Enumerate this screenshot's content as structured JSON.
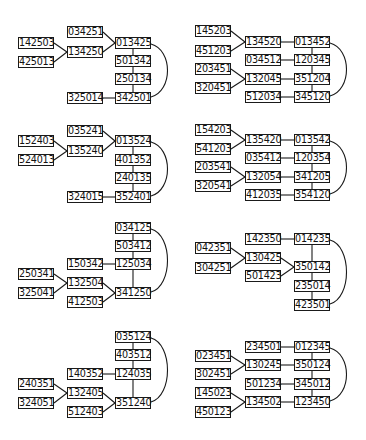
{
  "panels": [
    {
      "id": "p1",
      "nodes": [
        {
          "label": "034251",
          "x": 67,
          "y": 26
        },
        {
          "label": "142503",
          "x": 18,
          "y": 37
        },
        {
          "label": "013425",
          "x": 115,
          "y": 37
        },
        {
          "label": "134250",
          "x": 67,
          "y": 46
        },
        {
          "label": "425013",
          "x": 18,
          "y": 56
        },
        {
          "label": "501342",
          "x": 115,
          "y": 55
        },
        {
          "label": "250134",
          "x": 115,
          "y": 73
        },
        {
          "label": "325014",
          "x": 67,
          "y": 92
        },
        {
          "label": "342501",
          "x": 115,
          "y": 92
        }
      ],
      "edges": [
        [
          0,
          2
        ],
        [
          1,
          3
        ],
        [
          4,
          3
        ],
        [
          3,
          2
        ],
        [
          2,
          5
        ],
        [
          5,
          6
        ],
        [
          6,
          8
        ],
        [
          7,
          8
        ]
      ],
      "arcs": [
        [
          2,
          8
        ]
      ]
    },
    {
      "id": "p2",
      "nodes": [
        {
          "label": "145203",
          "x": 195,
          "y": 25
        },
        {
          "label": "134520",
          "x": 245,
          "y": 36
        },
        {
          "label": "013452",
          "x": 294,
          "y": 36
        },
        {
          "label": "451203",
          "x": 195,
          "y": 45
        },
        {
          "label": "034512",
          "x": 245,
          "y": 54
        },
        {
          "label": "120345",
          "x": 294,
          "y": 54
        },
        {
          "label": "203451",
          "x": 195,
          "y": 63
        },
        {
          "label": "132045",
          "x": 245,
          "y": 73
        },
        {
          "label": "351204",
          "x": 294,
          "y": 73
        },
        {
          "label": "320451",
          "x": 195,
          "y": 82
        },
        {
          "label": "512034",
          "x": 245,
          "y": 91
        },
        {
          "label": "345120",
          "x": 294,
          "y": 91
        }
      ],
      "edges": [
        [
          0,
          1
        ],
        [
          3,
          1
        ],
        [
          1,
          2
        ],
        [
          4,
          5
        ],
        [
          6,
          7
        ],
        [
          9,
          7
        ],
        [
          7,
          8
        ],
        [
          10,
          11
        ],
        [
          2,
          5
        ],
        [
          5,
          8
        ],
        [
          8,
          11
        ]
      ],
      "arcs": [
        [
          2,
          11
        ]
      ]
    },
    {
      "id": "p3",
      "nodes": [
        {
          "label": "035241",
          "x": 67,
          "y": 125
        },
        {
          "label": "152403",
          "x": 18,
          "y": 135
        },
        {
          "label": "013524",
          "x": 115,
          "y": 135
        },
        {
          "label": "135240",
          "x": 67,
          "y": 145
        },
        {
          "label": "524013",
          "x": 18,
          "y": 154
        },
        {
          "label": "401352",
          "x": 115,
          "y": 154
        },
        {
          "label": "240135",
          "x": 115,
          "y": 172
        },
        {
          "label": "324015",
          "x": 67,
          "y": 191
        },
        {
          "label": "352401",
          "x": 115,
          "y": 191
        }
      ],
      "edges": [
        [
          0,
          2
        ],
        [
          1,
          3
        ],
        [
          4,
          3
        ],
        [
          3,
          2
        ],
        [
          2,
          5
        ],
        [
          5,
          6
        ],
        [
          6,
          8
        ],
        [
          7,
          8
        ]
      ],
      "arcs": [
        [
          2,
          8
        ]
      ]
    },
    {
      "id": "p4",
      "nodes": [
        {
          "label": "154203",
          "x": 195,
          "y": 124
        },
        {
          "label": "135420",
          "x": 245,
          "y": 134
        },
        {
          "label": "013542",
          "x": 294,
          "y": 134
        },
        {
          "label": "541203",
          "x": 195,
          "y": 143
        },
        {
          "label": "035412",
          "x": 245,
          "y": 152
        },
        {
          "label": "120354",
          "x": 294,
          "y": 152
        },
        {
          "label": "203541",
          "x": 195,
          "y": 161
        },
        {
          "label": "132054",
          "x": 245,
          "y": 171
        },
        {
          "label": "341205",
          "x": 294,
          "y": 171
        },
        {
          "label": "320541",
          "x": 195,
          "y": 180
        },
        {
          "label": "412035",
          "x": 245,
          "y": 189
        },
        {
          "label": "354120",
          "x": 294,
          "y": 189
        }
      ],
      "edges": [
        [
          0,
          1
        ],
        [
          3,
          1
        ],
        [
          1,
          2
        ],
        [
          4,
          5
        ],
        [
          6,
          7
        ],
        [
          9,
          7
        ],
        [
          7,
          8
        ],
        [
          10,
          11
        ],
        [
          2,
          5
        ],
        [
          5,
          8
        ],
        [
          8,
          11
        ]
      ],
      "arcs": [
        [
          2,
          11
        ]
      ]
    },
    {
      "id": "p5",
      "nodes": [
        {
          "label": "034125",
          "x": 115,
          "y": 222
        },
        {
          "label": "503412",
          "x": 115,
          "y": 240
        },
        {
          "label": "150342",
          "x": 67,
          "y": 258
        },
        {
          "label": "125034",
          "x": 115,
          "y": 258
        },
        {
          "label": "250341",
          "x": 18,
          "y": 268
        },
        {
          "label": "132504",
          "x": 67,
          "y": 277
        },
        {
          "label": "325041",
          "x": 18,
          "y": 287
        },
        {
          "label": "341250",
          "x": 115,
          "y": 287
        },
        {
          "label": "412503",
          "x": 67,
          "y": 296
        }
      ],
      "edges": [
        [
          0,
          1
        ],
        [
          1,
          3
        ],
        [
          2,
          3
        ],
        [
          3,
          7
        ],
        [
          4,
          5
        ],
        [
          6,
          5
        ],
        [
          5,
          7
        ],
        [
          8,
          7
        ]
      ],
      "arcs": [
        [
          0,
          7
        ]
      ]
    },
    {
      "id": "p6",
      "nodes": [
        {
          "label": "142350",
          "x": 245,
          "y": 233
        },
        {
          "label": "014235",
          "x": 294,
          "y": 233
        },
        {
          "label": "042351",
          "x": 195,
          "y": 242
        },
        {
          "label": "130425",
          "x": 245,
          "y": 252
        },
        {
          "label": "304251",
          "x": 195,
          "y": 262
        },
        {
          "label": "350142",
          "x": 294,
          "y": 261
        },
        {
          "label": "501423",
          "x": 245,
          "y": 270
        },
        {
          "label": "235014",
          "x": 294,
          "y": 280
        },
        {
          "label": "423501",
          "x": 294,
          "y": 299
        }
      ],
      "edges": [
        [
          0,
          1
        ],
        [
          2,
          3
        ],
        [
          4,
          3
        ],
        [
          3,
          5
        ],
        [
          6,
          5
        ],
        [
          1,
          5
        ],
        [
          5,
          7
        ],
        [
          7,
          8
        ]
      ],
      "arcs": [
        [
          1,
          8
        ]
      ]
    },
    {
      "id": "p7",
      "nodes": [
        {
          "label": "035124",
          "x": 115,
          "y": 331
        },
        {
          "label": "403512",
          "x": 115,
          "y": 349
        },
        {
          "label": "140352",
          "x": 67,
          "y": 368
        },
        {
          "label": "124035",
          "x": 115,
          "y": 368
        },
        {
          "label": "240351",
          "x": 18,
          "y": 378
        },
        {
          "label": "132405",
          "x": 67,
          "y": 387
        },
        {
          "label": "324051",
          "x": 18,
          "y": 397
        },
        {
          "label": "351240",
          "x": 115,
          "y": 397
        },
        {
          "label": "512403",
          "x": 67,
          "y": 406
        }
      ],
      "edges": [
        [
          0,
          1
        ],
        [
          1,
          3
        ],
        [
          2,
          3
        ],
        [
          3,
          7
        ],
        [
          4,
          5
        ],
        [
          6,
          5
        ],
        [
          5,
          7
        ],
        [
          8,
          7
        ]
      ],
      "arcs": [
        [
          0,
          7
        ]
      ]
    },
    {
      "id": "p8",
      "nodes": [
        {
          "label": "234501",
          "x": 245,
          "y": 341
        },
        {
          "label": "012345",
          "x": 294,
          "y": 341
        },
        {
          "label": "023451",
          "x": 195,
          "y": 350
        },
        {
          "label": "130245",
          "x": 245,
          "y": 359
        },
        {
          "label": "350124",
          "x": 294,
          "y": 359
        },
        {
          "label": "302451",
          "x": 195,
          "y": 368
        },
        {
          "label": "501234",
          "x": 245,
          "y": 378
        },
        {
          "label": "345012",
          "x": 294,
          "y": 378
        },
        {
          "label": "145023",
          "x": 195,
          "y": 387
        },
        {
          "label": "134502",
          "x": 245,
          "y": 396
        },
        {
          "label": "123450",
          "x": 294,
          "y": 396
        },
        {
          "label": "450123",
          "x": 195,
          "y": 406
        }
      ],
      "edges": [
        [
          0,
          1
        ],
        [
          2,
          3
        ],
        [
          5,
          3
        ],
        [
          3,
          4
        ],
        [
          6,
          7
        ],
        [
          8,
          9
        ],
        [
          11,
          9
        ],
        [
          9,
          10
        ],
        [
          1,
          4
        ],
        [
          4,
          7
        ],
        [
          7,
          10
        ]
      ],
      "arcs": [
        [
          1,
          10
        ]
      ]
    }
  ],
  "style": {
    "line_color": "#1a1a1a",
    "box_border": "#1a1a1a",
    "background": "#ffffff"
  }
}
